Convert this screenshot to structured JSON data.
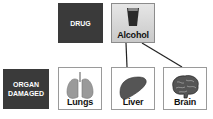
{
  "diagram": {
    "row_labels": {
      "drug": "DRUG",
      "organ_line1": "ORGAN",
      "organ_line2": "DAMAGED"
    },
    "drug": {
      "label": "Alcohol",
      "icon": "glass-icon"
    },
    "organs": [
      {
        "label": "Lungs",
        "icon": "lungs-icon",
        "connected": false
      },
      {
        "label": "Liver",
        "icon": "liver-icon",
        "connected": true
      },
      {
        "label": "Brain",
        "icon": "brain-icon",
        "connected": true
      }
    ],
    "colors": {
      "label_bg": "#3a3a3a",
      "tile_border": "#9a9a9a",
      "drug_tile_bg": "#d8d8d8"
    }
  }
}
